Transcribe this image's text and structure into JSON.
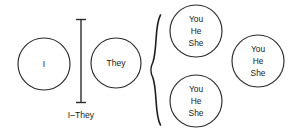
{
  "diagram": {
    "type": "concept-diagram",
    "canvas": {
      "width": 292,
      "height": 135,
      "background": "#ffffff"
    },
    "stroke_color": "#2b2b2b",
    "text_color": "#1a1a1a",
    "nodes": [
      {
        "id": "node-i",
        "name": "circle-i",
        "lines": [
          "I"
        ],
        "cx": 44,
        "cy": 64,
        "r": 26
      },
      {
        "id": "node-they",
        "name": "circle-they",
        "lines": [
          "They"
        ],
        "cx": 116,
        "cy": 63,
        "r": 25
      },
      {
        "id": "node-you-he-she-top",
        "name": "circle-you-he-she-top",
        "lines": [
          "You",
          "He",
          "She"
        ],
        "cx": 196,
        "cy": 31,
        "r": 26
      },
      {
        "id": "node-you-he-she-bottom",
        "name": "circle-you-he-she-bottom",
        "lines": [
          "You",
          "He",
          "She"
        ],
        "cx": 196,
        "cy": 101,
        "r": 26
      },
      {
        "id": "node-you-he-she-right",
        "name": "circle-you-he-she-right",
        "lines": [
          "You",
          "He",
          "She"
        ],
        "cx": 258,
        "cy": 61,
        "r": 26
      }
    ],
    "dimension": {
      "name": "i-they-dimension",
      "label": "I–They",
      "x": 81,
      "y_top": 19,
      "y_bottom": 103,
      "cap_half_width": 5,
      "label_x": 81,
      "label_y": 116
    },
    "brace": {
      "name": "curly-brace",
      "glyph": "{",
      "x": 157,
      "y_top": 15,
      "y_bottom": 125
    }
  }
}
